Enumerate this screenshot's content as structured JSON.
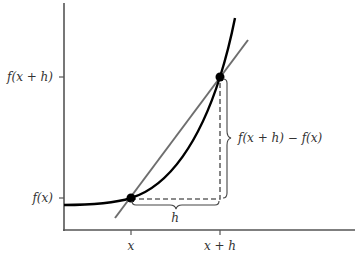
{
  "diagram": {
    "axes": {
      "x_ticks": [
        {
          "label": "x",
          "px": 131
        },
        {
          "label": "x + h",
          "px": 220
        }
      ],
      "y_ticks": [
        {
          "label": "f(x + h)",
          "py": 77
        },
        {
          "label": "f(x)",
          "py": 198
        }
      ]
    },
    "annotations": {
      "horizontal_brace": "h",
      "vertical_brace": "f(x + h) − f(x)"
    },
    "labels": {
      "x_tick_1": "x",
      "x_tick_2": "x + h",
      "y_tick_1": "f(x + h)",
      "y_tick_2": "f(x)",
      "delta_x": "h",
      "delta_y": "f(x + h) − f(x)"
    },
    "colors": {
      "curve": "#000000",
      "secant": "#6e6e6e",
      "axes": "#555555",
      "dashed": "#666666"
    }
  }
}
